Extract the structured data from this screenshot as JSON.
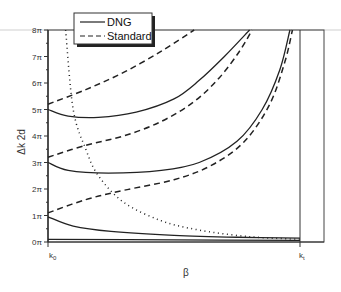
{
  "chart_data": {
    "type": "line",
    "title": "",
    "xlabel": "β",
    "ylabel": "Δk 2d",
    "ylim": [
      0,
      8
    ],
    "y_unit": "π",
    "yticks": [
      "0π",
      "1π",
      "2π",
      "3π",
      "4π",
      "5π",
      "6π",
      "7π",
      "8π"
    ],
    "xticks": [
      "k₀",
      "kₜ"
    ],
    "x_tick_names": {
      "left": "k₀",
      "right": "kₜ"
    },
    "grid": false,
    "legend_position": "top-left (overlapping top border)",
    "legend": [
      {
        "name": "DNG",
        "style": "solid"
      },
      {
        "name": "Standard",
        "style": "dashed"
      }
    ],
    "x_normalized_note": "x from 0 (k0) to 1 (kt); y in units of π",
    "series": [
      {
        "name": "DNG",
        "style": "solid",
        "branch": 0,
        "points": [
          [
            0,
            0.1
          ],
          [
            0.5,
            0.08
          ],
          [
            1,
            0.06
          ]
        ]
      },
      {
        "name": "DNG",
        "style": "solid",
        "branch": 1,
        "points": [
          [
            0,
            0.95
          ],
          [
            0.1,
            0.6
          ],
          [
            0.25,
            0.4
          ],
          [
            0.5,
            0.25
          ],
          [
            0.75,
            0.18
          ],
          [
            1,
            0.15
          ]
        ]
      },
      {
        "name": "DNG",
        "style": "solid",
        "branch": 2,
        "points": [
          [
            0,
            3.0
          ],
          [
            0.08,
            2.7
          ],
          [
            0.24,
            2.6
          ],
          [
            0.45,
            2.7
          ],
          [
            0.6,
            3.0
          ],
          [
            0.75,
            3.8
          ],
          [
            0.85,
            5.0
          ],
          [
            0.92,
            6.5
          ],
          [
            0.96,
            8.0
          ]
        ]
      },
      {
        "name": "DNG",
        "style": "solid",
        "branch": 3,
        "points": [
          [
            0,
            5.0
          ],
          [
            0.08,
            4.75
          ],
          [
            0.2,
            4.7
          ],
          [
            0.35,
            4.9
          ],
          [
            0.5,
            5.4
          ],
          [
            0.6,
            6.1
          ],
          [
            0.7,
            7.0
          ],
          [
            0.8,
            8.0
          ]
        ]
      },
      {
        "name": "Standard",
        "style": "dashed",
        "branch": 1,
        "points": [
          [
            0,
            1.1
          ],
          [
            0.15,
            1.6
          ],
          [
            0.3,
            1.95
          ],
          [
            0.5,
            2.35
          ],
          [
            0.65,
            2.9
          ],
          [
            0.78,
            3.8
          ],
          [
            0.88,
            5.2
          ],
          [
            0.94,
            6.8
          ],
          [
            0.97,
            8.0
          ]
        ]
      },
      {
        "name": "Standard",
        "style": "dashed",
        "branch": 2,
        "points": [
          [
            0,
            3.2
          ],
          [
            0.15,
            3.65
          ],
          [
            0.3,
            4.0
          ],
          [
            0.45,
            4.55
          ],
          [
            0.58,
            5.3
          ],
          [
            0.68,
            6.2
          ],
          [
            0.76,
            7.2
          ],
          [
            0.81,
            8.0
          ]
        ]
      },
      {
        "name": "Standard",
        "style": "dashed",
        "branch": 3,
        "points": [
          [
            0,
            5.2
          ],
          [
            0.15,
            5.75
          ],
          [
            0.3,
            6.4
          ],
          [
            0.45,
            7.2
          ],
          [
            0.58,
            8.0
          ]
        ]
      },
      {
        "name": "light line",
        "style": "dotted",
        "points": [
          [
            0.07,
            8.0
          ],
          [
            0.1,
            5.0
          ],
          [
            0.15,
            3.5
          ],
          [
            0.2,
            2.5
          ],
          [
            0.3,
            1.5
          ],
          [
            0.45,
            0.8
          ],
          [
            0.6,
            0.45
          ],
          [
            0.8,
            0.2
          ],
          [
            1,
            0.1
          ]
        ]
      }
    ]
  },
  "legend": {
    "dng": "DNG",
    "standard": "Standard"
  },
  "axes": {
    "xlabel": "β",
    "ylabel": "Δk 2d",
    "k0": "k",
    "k0_sub": "0",
    "kt": "k",
    "kt_sub": "t"
  },
  "yticks": [
    "0π",
    "1π",
    "2π",
    "3π",
    "4π",
    "5π",
    "6π",
    "7π",
    "8π"
  ]
}
